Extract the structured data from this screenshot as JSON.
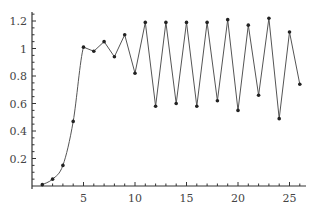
{
  "chart_data": {
    "type": "line",
    "title": "",
    "xlabel": "",
    "ylabel": "",
    "x": [
      1,
      2,
      3,
      4,
      5,
      6,
      7,
      8,
      9,
      10,
      11,
      12,
      13,
      14,
      15,
      16,
      17,
      18,
      19,
      20,
      21,
      22,
      23,
      24,
      25,
      26
    ],
    "series": [
      {
        "name": "",
        "values": [
          0.01,
          0.05,
          0.15,
          0.47,
          1.01,
          0.98,
          1.05,
          0.94,
          1.1,
          0.82,
          1.19,
          0.58,
          1.19,
          0.6,
          1.19,
          0.58,
          1.19,
          0.62,
          1.21,
          0.55,
          1.17,
          0.66,
          1.22,
          0.49,
          1.12,
          0.74
        ]
      }
    ],
    "xticks": [
      "5",
      "10",
      "15",
      "20",
      "25"
    ],
    "yticks": [
      "0.2",
      "0.4",
      "0.6",
      "0.8",
      "1",
      "1.2"
    ],
    "xlim": [
      0,
      27
    ],
    "ylim": [
      0,
      1.27
    ],
    "grid": false,
    "legend": "none",
    "colors": {
      "line": "#555555",
      "marker": "#222222",
      "axis": "#333333"
    }
  }
}
